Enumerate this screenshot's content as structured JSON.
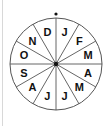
{
  "diagram": {
    "type": "month-wheel",
    "center": [
      56,
      64
    ],
    "radius": 46,
    "segments": 12,
    "top_marker": true,
    "labels": [
      "J",
      "F",
      "M",
      "A",
      "M",
      "J",
      "J",
      "A",
      "S",
      "O",
      "N",
      "D"
    ],
    "colors": {
      "line": "#555555",
      "text": "#111111",
      "background": "#ffffff",
      "frame": "#d8d8d8"
    }
  }
}
